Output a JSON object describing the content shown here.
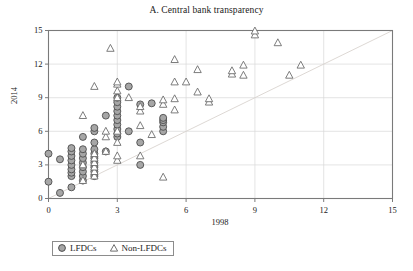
{
  "chart_data": {
    "type": "scatter",
    "title": "A. Central bank transparency",
    "xlabel": "1998",
    "ylabel": "2014",
    "xlim": [
      0,
      15
    ],
    "ylim": [
      0,
      15
    ],
    "xticks": [
      "0",
      "3",
      "6",
      "9",
      "12",
      "15"
    ],
    "yticks": [
      "0",
      "3",
      "6",
      "9",
      "12",
      "15"
    ],
    "xtick_values": [
      0,
      3,
      6,
      9,
      12,
      15
    ],
    "ytick_values": [
      0,
      3,
      6,
      9,
      12,
      15
    ],
    "grid": "horizontal-and-vertical-light",
    "legend_position": "below-axes-left",
    "reference_line": {
      "type": "45-degree",
      "from": [
        0,
        0
      ],
      "to": [
        15,
        15
      ],
      "color": "#d9d4cf"
    },
    "colors": {
      "lfdc_fill": "#a6a6a6",
      "lfdc_stroke": "#4d4d4d",
      "non_lfdc_fill": "#ffffff",
      "non_lfdc_stroke": "#6e6e6e",
      "axis": "#7a7a7a",
      "grid": "#d9d9d9",
      "text": "#1a1a1a"
    },
    "series": [
      {
        "name": "LFDCs",
        "marker": "circle",
        "points": [
          [
            0,
            1.5
          ],
          [
            0,
            4
          ],
          [
            0.5,
            0.5
          ],
          [
            0.5,
            3.5
          ],
          [
            1,
            1
          ],
          [
            1,
            2
          ],
          [
            1,
            2.3
          ],
          [
            1,
            2.6
          ],
          [
            1,
            3
          ],
          [
            1,
            3.4
          ],
          [
            1,
            3.8
          ],
          [
            1,
            4.2
          ],
          [
            1,
            4.5
          ],
          [
            1.5,
            1.6
          ],
          [
            1.5,
            2
          ],
          [
            1.5,
            2.4
          ],
          [
            1.5,
            2.8
          ],
          [
            1.5,
            3.2
          ],
          [
            1.5,
            3.6
          ],
          [
            1.5,
            4
          ],
          [
            1.5,
            4.4
          ],
          [
            1.5,
            5.5
          ],
          [
            2,
            2
          ],
          [
            2,
            2.4
          ],
          [
            2,
            2.8
          ],
          [
            2,
            3.2
          ],
          [
            2,
            3.6
          ],
          [
            2,
            4
          ],
          [
            2,
            4.4
          ],
          [
            2,
            5
          ],
          [
            2,
            6
          ],
          [
            2,
            6.3
          ],
          [
            2.5,
            4.2
          ],
          [
            2.5,
            7.4
          ],
          [
            3,
            5.5
          ],
          [
            3,
            5.8
          ],
          [
            3,
            6.2
          ],
          [
            3,
            6.6
          ],
          [
            3,
            7
          ],
          [
            3,
            7.4
          ],
          [
            3,
            7.8
          ],
          [
            3,
            8.2
          ],
          [
            3,
            8.6
          ],
          [
            3,
            9
          ],
          [
            3.5,
            6
          ],
          [
            3.5,
            10
          ],
          [
            4,
            3
          ],
          [
            4,
            5
          ],
          [
            4,
            8.4
          ],
          [
            4.5,
            8.5
          ],
          [
            5,
            6
          ],
          [
            5,
            6.4
          ],
          [
            5,
            6.8
          ],
          [
            5,
            7
          ],
          [
            5,
            7.2
          ]
        ]
      },
      {
        "name": "Non-LFDCs",
        "marker": "triangle",
        "points": [
          [
            1.5,
            1.6
          ],
          [
            1.5,
            3
          ],
          [
            1.5,
            7.4
          ],
          [
            2,
            2
          ],
          [
            2,
            2.4
          ],
          [
            2,
            2.8
          ],
          [
            2,
            3.2
          ],
          [
            2,
            3.6
          ],
          [
            2,
            4
          ],
          [
            2,
            10
          ],
          [
            2.5,
            4.2
          ],
          [
            2.5,
            5.5
          ],
          [
            2.5,
            6
          ],
          [
            2.7,
            13.4
          ],
          [
            3,
            3.4
          ],
          [
            3,
            3.8
          ],
          [
            3,
            5
          ],
          [
            3,
            6
          ],
          [
            3,
            9
          ],
          [
            3,
            9.6
          ],
          [
            3,
            10.2
          ],
          [
            3,
            10.4
          ],
          [
            3.5,
            9
          ],
          [
            4,
            3.8
          ],
          [
            4,
            6.5
          ],
          [
            4,
            7.8
          ],
          [
            4,
            8.2
          ],
          [
            4.5,
            5.7
          ],
          [
            5,
            1.9
          ],
          [
            5,
            8.4
          ],
          [
            5,
            8.8
          ],
          [
            5.5,
            7.9
          ],
          [
            5.5,
            8.9
          ],
          [
            5.5,
            10.4
          ],
          [
            5.5,
            12.4
          ],
          [
            6,
            10.4
          ],
          [
            6.5,
            9.5
          ],
          [
            6.5,
            11.5
          ],
          [
            7,
            8.6
          ],
          [
            7,
            8.9
          ],
          [
            8,
            11.1
          ],
          [
            8,
            11.4
          ],
          [
            8.5,
            11
          ],
          [
            8.5,
            11.9
          ],
          [
            9,
            14.6
          ],
          [
            9,
            14.95
          ],
          [
            10,
            13.9
          ],
          [
            10.5,
            11
          ],
          [
            11,
            11.9
          ]
        ]
      }
    ]
  },
  "legend": {
    "items": [
      {
        "label": "LFDCs",
        "marker": "circle"
      },
      {
        "label": "Non-LFDCs",
        "marker": "triangle"
      }
    ]
  }
}
